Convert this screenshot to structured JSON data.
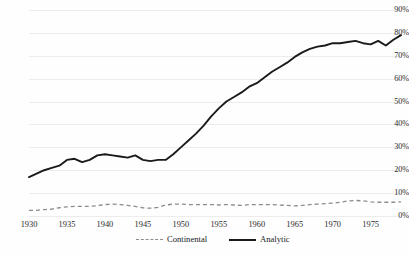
{
  "chart_data": {
    "type": "line",
    "title": "",
    "xlabel": "",
    "ylabel": "",
    "xlim": [
      1930,
      1979
    ],
    "ylim": [
      0,
      90
    ],
    "grid": true,
    "legend_position": "bottom",
    "y_ticks": [
      "0%",
      "10%",
      "20%",
      "30%",
      "40%",
      "50%",
      "60%",
      "70%",
      "80%",
      "90%"
    ],
    "y_tick_values": [
      0,
      10,
      20,
      30,
      40,
      50,
      60,
      70,
      80,
      90
    ],
    "x_ticks": [
      "1930",
      "1935",
      "1940",
      "1945",
      "1950",
      "1955",
      "1960",
      "1965",
      "1970",
      "1975"
    ],
    "x_tick_values": [
      1930,
      1935,
      1940,
      1945,
      1950,
      1955,
      1960,
      1965,
      1970,
      1975
    ],
    "x": [
      1930,
      1931,
      1932,
      1933,
      1934,
      1935,
      1936,
      1937,
      1938,
      1939,
      1940,
      1941,
      1942,
      1943,
      1944,
      1945,
      1946,
      1947,
      1948,
      1949,
      1950,
      1951,
      1952,
      1953,
      1954,
      1955,
      1956,
      1957,
      1958,
      1959,
      1960,
      1961,
      1962,
      1963,
      1964,
      1965,
      1966,
      1967,
      1968,
      1969,
      1970,
      1971,
      1972,
      1973,
      1974,
      1975,
      1976,
      1977,
      1978,
      1979
    ],
    "series": [
      {
        "name": "Analytic",
        "style": "solid",
        "color": "#1a1a1a",
        "values": [
          17,
          18.5,
          20,
          21,
          22,
          24.5,
          25,
          23.5,
          24.5,
          26.5,
          27,
          26.5,
          26,
          25.5,
          26.5,
          24.5,
          24,
          24.5,
          24.5,
          27,
          30,
          33,
          36,
          39.5,
          43.5,
          47,
          50,
          52,
          54,
          56.5,
          58,
          60.5,
          63,
          65,
          67,
          69.5,
          71.5,
          73,
          74,
          74.5,
          75.5,
          75.5,
          76,
          76.5,
          75.5,
          75,
          76.5,
          74.5,
          77,
          79
        ]
      },
      {
        "name": "Continental",
        "style": "dashed",
        "color": "#8c8c8c",
        "values": [
          2.5,
          2.5,
          2.8,
          3,
          3.6,
          4,
          4.2,
          4.2,
          4.2,
          4.5,
          5,
          5.2,
          5,
          4.6,
          4.2,
          3.6,
          3.4,
          3.8,
          4.8,
          5.2,
          5.2,
          5,
          5,
          5,
          5,
          4.8,
          5,
          4.8,
          4.6,
          5,
          5,
          5,
          5,
          4.8,
          4.6,
          4.4,
          4.6,
          5,
          5.2,
          5.4,
          5.6,
          6,
          6.6,
          6.8,
          6.6,
          6.2,
          6,
          6,
          6,
          6.2
        ]
      }
    ],
    "legend": [
      {
        "label": "Continental",
        "style": "dashed"
      },
      {
        "label": "Analytic",
        "style": "solid"
      }
    ]
  }
}
